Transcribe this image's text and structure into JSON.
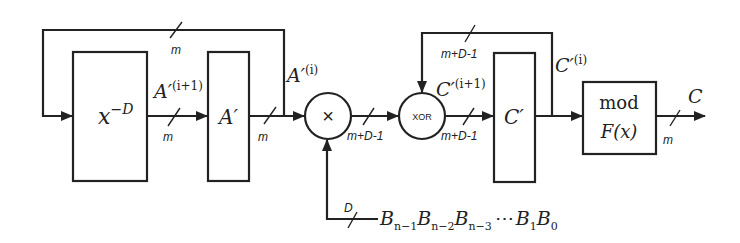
{
  "diagram": {
    "blocks": {
      "delay": {
        "label_base": "x",
        "label_sup": "−D"
      },
      "a_register": {
        "label": "A′"
      },
      "multiplier": {
        "symbol": "×"
      },
      "xor": {
        "label": "XOR"
      },
      "c_register": {
        "label": "C′"
      },
      "reduction": {
        "line1": "mod",
        "line2": "F(x)"
      }
    },
    "signals": {
      "a_next": {
        "base": "A′",
        "sup": "(i+1)"
      },
      "a_current": {
        "base": "A′",
        "sup": "(i)"
      },
      "c_next": {
        "base": "C′",
        "sup": "(i+1)"
      },
      "c_current": {
        "base": "C′",
        "sup": "(i)"
      },
      "output": "C",
      "b_input": [
        {
          "base": "B",
          "sub": "n−1"
        },
        {
          "base": "B",
          "sub": "n−2"
        },
        {
          "base": "B",
          "sub": "n−3"
        },
        {
          "base": "⋯",
          "sub": ""
        },
        {
          "base": "B",
          "sub": "1"
        },
        {
          "base": "B",
          "sub": "0"
        }
      ]
    },
    "bus_widths": {
      "a_feedback": "m",
      "delay_to_a": "m",
      "a_to_mult": "m",
      "mult_to_xor": "m+D-1",
      "xor_to_c": "m+D-1",
      "c_feedback": "m+D-1",
      "b_input": "D",
      "output": "m"
    }
  }
}
